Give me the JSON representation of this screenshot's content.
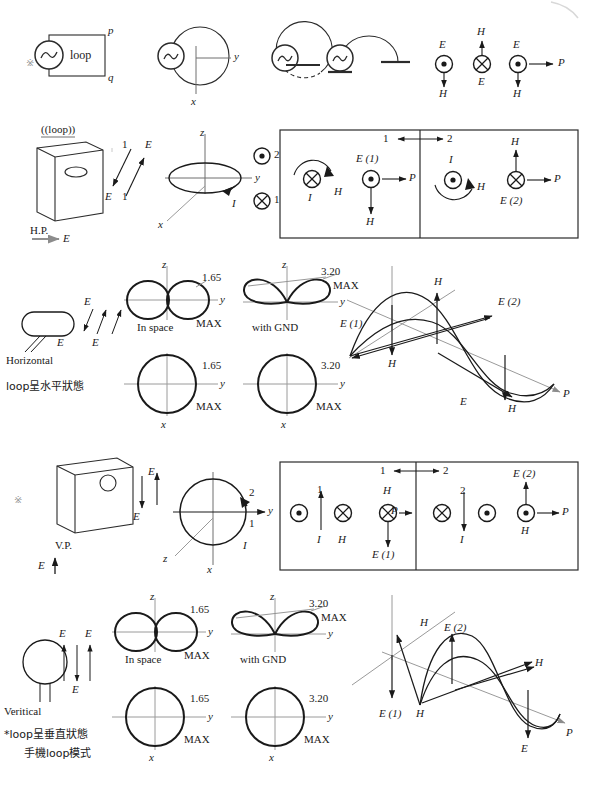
{
  "page": {
    "bullet": "※",
    "ink": "#1a1a1a",
    "axis_color": "#8c8c8c"
  },
  "row1": {
    "source_label": "loop",
    "terminal_p": "p",
    "terminal_q": "q",
    "axis_y": "y",
    "axis_x": "x",
    "field_E_left": "E",
    "field_H_up": "H",
    "field_E_mid": "E",
    "field_H_left_down": "H",
    "field_E_right": "E",
    "field_H_right_down": "H",
    "poynting": "P"
  },
  "row2": {
    "loop_caption": "((loop))",
    "hp_label": "H.P.",
    "hp_E": "E",
    "arrow_1a": "1",
    "arrow_1b": "1",
    "E_up": "E",
    "E_down": "E",
    "axis_z": "z",
    "axis_y": "y",
    "axis_x": "x",
    "current_I": "I",
    "dot_2": "2",
    "cross_1": "1",
    "panel": {
      "pair_left": "1",
      "pair_right": "2",
      "left": {
        "current_I": "I",
        "H_curl": "H",
        "E_label": "E (1)",
        "H_down": "H",
        "poynting": "P"
      },
      "right": {
        "current_I": "I",
        "H_curl": "H",
        "H_up": "H",
        "E_label": "E (2)",
        "poynting": "P"
      }
    }
  },
  "row3": {
    "orientation_name": "Horizontal",
    "orientation_note": "loop呈水平狀態",
    "E_a": "E",
    "E_b": "E",
    "E_c": "E",
    "patterns": [
      {
        "caption": "In space",
        "gain_top": "1.65",
        "max_top": "MAX",
        "gain_bottom": "1.65",
        "max_bottom": "MAX",
        "axis_z": "z",
        "axis_y": "y",
        "axis_x": "x",
        "top_shape": "figure-eight-horizontal",
        "bottom_shape": "circle"
      },
      {
        "caption": "with GND",
        "gain_top": "3.20",
        "max_top": "MAX",
        "gain_bottom": "3.20",
        "max_bottom": "MAX",
        "axis_z": "z",
        "axis_y": "y",
        "axis_x": "x",
        "top_shape": "tilted-twin-lobes",
        "bottom_shape": "circle"
      }
    ],
    "wave": {
      "E1": "E (1)",
      "E2": "E (2)",
      "H_top": "H",
      "H_low": "H",
      "E_low": "E",
      "H_right": "H",
      "poynting": "P"
    }
  },
  "row4": {
    "bullet": "※",
    "vp_label": "V.P.",
    "vp_E": "E",
    "E_up": "E",
    "E_down": "E",
    "axis_z": "z",
    "axis_y": "y",
    "axis_x": "x",
    "current_I": "I",
    "mark_2": "2",
    "mark_1": "1",
    "panel": {
      "pair_left": "1",
      "pair_right": "2",
      "left": {
        "num_1": "1",
        "current_I": "I",
        "H_label": "H",
        "H_top": "H",
        "E_label": "E (1)",
        "poynting": "P"
      },
      "right": {
        "num_2": "2",
        "current_I": "I",
        "E_label": "E (2)",
        "H_label": "H",
        "poynting": "P"
      }
    }
  },
  "row5": {
    "orientation_name": "Veritical",
    "orientation_note_1": "*loop呈垂直狀態",
    "orientation_note_2": "手機loop模式",
    "E_a": "E",
    "E_b": "E",
    "E_c": "E",
    "patterns": [
      {
        "caption": "In space",
        "gain_top": "1.65",
        "max_top": "MAX",
        "gain_bottom": "1.65",
        "max_bottom": "MAX",
        "axis_z": "z",
        "axis_y": "y",
        "axis_x": "x",
        "top_shape": "figure-eight-horizontal",
        "bottom_shape": "circle"
      },
      {
        "caption": "with GND",
        "gain_top": "3.20",
        "max_top": "MAX",
        "gain_bottom": "3.20",
        "max_bottom": "MAX",
        "axis_z": "z",
        "axis_y": "y",
        "axis_x": "x",
        "top_shape": "tilted-twin-lobes",
        "bottom_shape": "circle"
      }
    ],
    "wave": {
      "E1": "E (1)",
      "E2": "E (2)",
      "H_top": "H",
      "H_low": "H",
      "E_low": "E",
      "H_right": "H",
      "poynting": "P"
    }
  }
}
